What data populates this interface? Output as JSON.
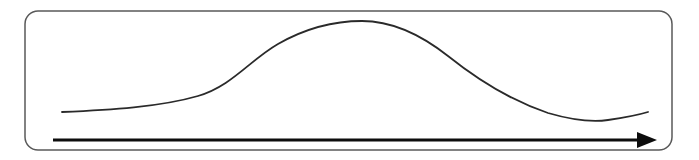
{
  "figure": {
    "background_color": "#ffffff",
    "width": 699,
    "height": 160
  },
  "frame": {
    "name": "rounded-rectangle-border",
    "x": 25,
    "y": 11,
    "width": 647,
    "height": 139,
    "corner_radius": 13,
    "stroke_color": "#595959",
    "stroke_width": 1.5,
    "fill": "none"
  },
  "axis_arrow": {
    "name": "horizontal-axis-arrow",
    "start_x": 53,
    "end_x": 657,
    "y": 140,
    "shaft_end_x": 637,
    "stroke_color": "#0d0d0d",
    "stroke_width": 3,
    "head_length": 20,
    "head_half_height": 8,
    "direction": "right"
  },
  "chart_data": {
    "type": "line",
    "subtitle": "",
    "xlabel": "",
    "ylabel": "",
    "grid": false,
    "legend": "none",
    "xlim": [
      53,
      657
    ],
    "ylim": [
      21,
      140
    ],
    "note": "y values are screen pixel coordinates; smaller y = higher on the plot",
    "series": [
      {
        "name": "bell-curve",
        "stroke_color": "#2a2a2a",
        "stroke_width": 1.8,
        "x": [
          62,
          100,
          140,
          180,
          215,
          255,
          290,
          325,
          362,
          400,
          435,
          470,
          505,
          540,
          570,
          590,
          608,
          625,
          640,
          648
        ],
        "y": [
          112,
          110,
          107,
          104,
          94,
          65,
          43,
          27,
          21,
          24,
          40,
          65,
          86,
          103,
          113,
          118,
          120,
          118,
          114,
          112
        ],
        "path": "M 62 112 C 110 110, 160 107, 198 96 C 232 86, 250 60, 278 44 C 306 28, 335 21, 362 21 C 392 21, 420 34, 448 56 C 478 80, 512 101, 548 113 C 572 120, 594 122, 608 120 C 622 118, 638 115, 648 112"
      }
    ]
  },
  "colors": {
    "stroke_dark": "#2a2a2a",
    "stroke_frame": "#595959",
    "arrow_black": "#0d0d0d",
    "background": "#ffffff"
  }
}
